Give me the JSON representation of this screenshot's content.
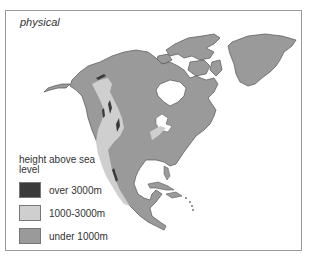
{
  "map": {
    "title": "physical",
    "region": "North America",
    "colors": {
      "over_3000": "#3a3a3a",
      "mid_1000_3000": "#cfcfcf",
      "under_1000": "#9a9a9a",
      "water": "#ffffff",
      "coast": "#555555"
    }
  },
  "legend": {
    "heading": "height above sea level",
    "items": [
      {
        "label": "over 3000m",
        "color": "#3a3a3a"
      },
      {
        "label": "1000-3000m",
        "color": "#cfcfcf"
      },
      {
        "label": "under 1000m",
        "color": "#9a9a9a"
      }
    ]
  }
}
